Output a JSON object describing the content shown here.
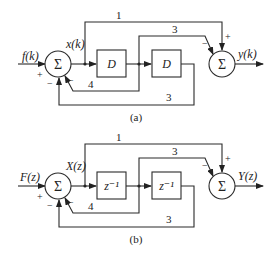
{
  "diagram_a": {
    "caption": "(a)",
    "input_label": "f(k)",
    "state_label": "x(k)",
    "output_label": "y(k)",
    "sum_symbol": "Σ",
    "block1_label": "D",
    "block2_label": "D",
    "gains": {
      "direct_path": "1",
      "to_output_after_block1": "3",
      "feedback_after_block1": "4",
      "feedback_after_block2": "3"
    },
    "signs": {
      "sum1_input": "+",
      "sum1_feedback_4": "−",
      "sum1_feedback_3": "−",
      "sum2_direct": "+",
      "sum2_gain3": "−"
    }
  },
  "diagram_b": {
    "caption": "(b)",
    "input_label": "F(z)",
    "state_label": "X(z)",
    "output_label": "Y(z)",
    "sum_symbol": "Σ",
    "block1_label": "z⁻¹",
    "block2_label": "z⁻¹",
    "gains": {
      "direct_path": "1",
      "to_output_after_block1": "3",
      "feedback_after_block1": "4",
      "feedback_after_block2": "3"
    },
    "signs": {
      "sum1_input": "+",
      "sum1_feedback_4": "−",
      "sum1_feedback_3": "−",
      "sum2_direct": "+",
      "sum2_gain3": "−"
    }
  }
}
